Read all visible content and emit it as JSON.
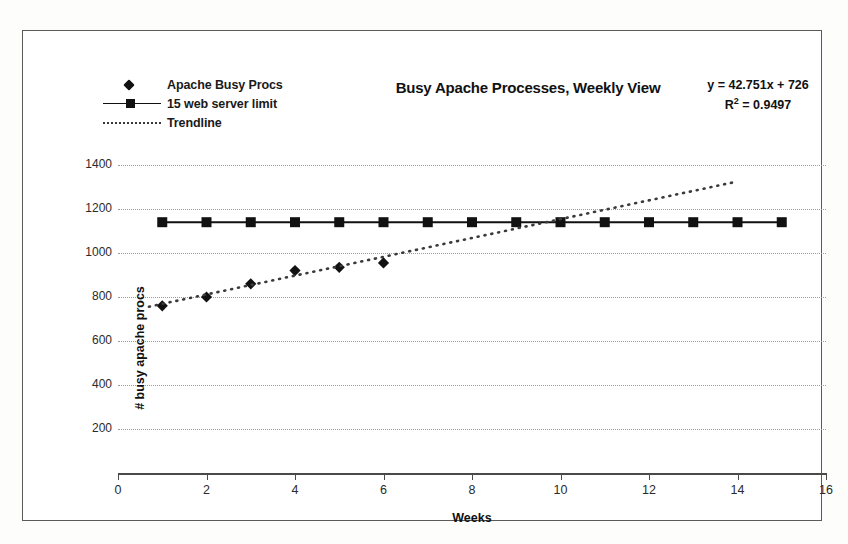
{
  "chart_data": {
    "type": "scatter",
    "title": "Busy Apache Processes, Weekly View",
    "xlabel": "Weeks",
    "ylabel": "# busy apache procs",
    "xlim": [
      0,
      16
    ],
    "ylim": [
      0,
      1500
    ],
    "xticks": [
      0,
      2,
      4,
      6,
      8,
      10,
      12,
      14,
      16
    ],
    "yticks": [
      200,
      400,
      600,
      800,
      1000,
      1200,
      1400
    ],
    "grid": "horizontal-dotted",
    "legend_position": "top-left",
    "annotations": {
      "equation": "y = 42.751x + 726",
      "r_squared_label": "R",
      "r_squared_sup": "2",
      "r_squared_value": " = 0.9497"
    },
    "series": [
      {
        "name": "Apache Busy Procs",
        "marker": "diamond",
        "color": "#111111",
        "x": [
          1,
          2,
          3,
          4,
          5,
          6
        ],
        "values": [
          760,
          800,
          860,
          920,
          935,
          955
        ]
      },
      {
        "name": "15 web server limit",
        "marker": "square",
        "color": "#111111",
        "x": [
          1,
          2,
          3,
          4,
          5,
          6,
          7,
          8,
          9,
          10,
          11,
          12,
          13,
          14,
          15
        ],
        "values": [
          1140,
          1140,
          1140,
          1140,
          1140,
          1140,
          1140,
          1140,
          1140,
          1140,
          1140,
          1140,
          1140,
          1140,
          1140
        ]
      },
      {
        "name": "Trendline",
        "marker": "none",
        "style": "dotted",
        "color": "#3a3a3a",
        "x": [
          0.7,
          14.0
        ],
        "values": [
          756,
          1325
        ]
      }
    ]
  },
  "legend": {
    "items": [
      {
        "label": "Apache Busy Procs",
        "key": "diamond-marker-icon"
      },
      {
        "label": "15 web server limit",
        "key": "line-square-marker-icon"
      },
      {
        "label": "Trendline",
        "key": "dotted-line-icon"
      }
    ]
  }
}
